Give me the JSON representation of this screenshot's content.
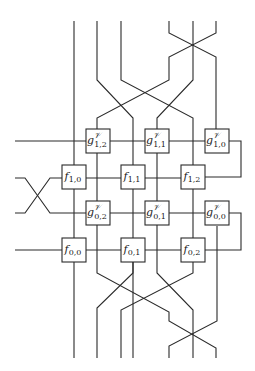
{
  "diagram": {
    "stroke_color": "#2a2a2a",
    "background": "#ffffff",
    "nodes": [
      {
        "id": "g12",
        "kind": "g",
        "letter": "g",
        "sup": "𝒱",
        "sub": "1,2",
        "cx": 98,
        "cy": 141
      },
      {
        "id": "g11",
        "kind": "g",
        "letter": "g",
        "sup": "𝒱",
        "sub": "1,1",
        "cx": 157,
        "cy": 141
      },
      {
        "id": "g10",
        "kind": "g",
        "letter": "g",
        "sup": "𝒱",
        "sub": "1,0",
        "cx": 217,
        "cy": 141
      },
      {
        "id": "f10",
        "kind": "f",
        "letter": "f",
        "sup": "",
        "sub": "1,0",
        "cx": 74,
        "cy": 177
      },
      {
        "id": "f11",
        "kind": "f",
        "letter": "f",
        "sup": "",
        "sub": "1,1",
        "cx": 133,
        "cy": 177
      },
      {
        "id": "f12",
        "kind": "f",
        "letter": "f",
        "sup": "",
        "sub": "1,2",
        "cx": 193,
        "cy": 177
      },
      {
        "id": "g02",
        "kind": "g",
        "letter": "g",
        "sup": "𝒱",
        "sub": "0,2",
        "cx": 98,
        "cy": 213
      },
      {
        "id": "g01",
        "kind": "g",
        "letter": "g",
        "sup": "𝒱",
        "sub": "0,1",
        "cx": 157,
        "cy": 213
      },
      {
        "id": "g00",
        "kind": "g",
        "letter": "g",
        "sup": "𝒱",
        "sub": "0,0",
        "cx": 217,
        "cy": 213
      },
      {
        "id": "f00",
        "kind": "f",
        "letter": "f",
        "sup": "",
        "sub": "0,0",
        "cx": 74,
        "cy": 250
      },
      {
        "id": "f01",
        "kind": "f",
        "letter": "f",
        "sup": "",
        "sub": "0,1",
        "cx": 133,
        "cy": 250
      },
      {
        "id": "f02",
        "kind": "f",
        "letter": "f",
        "sup": "",
        "sub": "0,2",
        "cx": 193,
        "cy": 250
      }
    ],
    "box_size": 24,
    "wires": [
      {
        "name": "top-wire-1",
        "points": [
          [
            74,
            21
          ],
          [
            74,
            358
          ]
        ]
      },
      {
        "name": "top-wire-2",
        "points": [
          [
            97,
            21
          ],
          [
            97,
            80
          ],
          [
            133,
            118
          ],
          [
            133,
            358
          ]
        ]
      },
      {
        "name": "top-wire-3",
        "points": [
          [
            121,
            21
          ],
          [
            121,
            80
          ],
          [
            193,
            118
          ],
          [
            193,
            262
          ]
        ]
      },
      {
        "name": "top-wire-4",
        "points": [
          [
            169,
            21
          ],
          [
            169,
            33
          ],
          [
            216,
            57
          ],
          [
            216,
            80
          ],
          [
            216,
            129
          ]
        ]
      },
      {
        "name": "top-wire-5",
        "points": [
          [
            193,
            21
          ],
          [
            193,
            80
          ],
          [
            157,
            118
          ],
          [
            157,
            262
          ]
        ]
      },
      {
        "name": "top-wire-6",
        "points": [
          [
            216,
            21
          ],
          [
            216,
            33
          ],
          [
            169,
            57
          ],
          [
            169,
            80
          ],
          [
            97,
            118
          ],
          [
            97,
            262
          ]
        ]
      },
      {
        "name": "row-g1",
        "points": [
          [
            15,
            141
          ],
          [
            241,
            141
          ],
          [
            241,
            177
          ],
          [
            205,
            177
          ]
        ]
      },
      {
        "name": "row-f1",
        "points": [
          [
            15,
            178
          ],
          [
            25,
            178
          ],
          [
            50,
            213
          ],
          [
            62,
            213
          ],
          [
            241,
            213
          ],
          [
            241,
            250
          ],
          [
            205,
            250
          ]
        ]
      },
      {
        "name": "row-g0-cross",
        "points": [
          [
            15,
            213
          ],
          [
            25,
            213
          ],
          [
            50,
            178
          ],
          [
            62,
            178
          ],
          [
            181,
            178
          ]
        ]
      },
      {
        "name": "row-f0",
        "points": [
          [
            15,
            250
          ],
          [
            181,
            250
          ]
        ]
      },
      {
        "name": "bottom-wire-a",
        "points": [
          [
            97,
            262
          ],
          [
            97,
            273
          ],
          [
            169,
            312
          ],
          [
            169,
            321
          ],
          [
            216,
            348
          ],
          [
            216,
            358
          ]
        ]
      },
      {
        "name": "bottom-wire-b",
        "points": [
          [
            133,
            262
          ],
          [
            133,
            273
          ],
          [
            97,
            308
          ],
          [
            97,
            358
          ]
        ]
      },
      {
        "name": "bottom-wire-c",
        "points": [
          [
            157,
            262
          ],
          [
            157,
            273
          ],
          [
            193,
            310
          ],
          [
            193,
            358
          ]
        ]
      },
      {
        "name": "bottom-wire-d",
        "points": [
          [
            193,
            262
          ],
          [
            193,
            273
          ],
          [
            121,
            310
          ],
          [
            121,
            358
          ]
        ]
      },
      {
        "name": "bottom-wire-e",
        "points": [
          [
            217,
            226
          ],
          [
            217,
            321
          ],
          [
            169,
            346
          ],
          [
            169,
            358
          ]
        ]
      }
    ]
  }
}
